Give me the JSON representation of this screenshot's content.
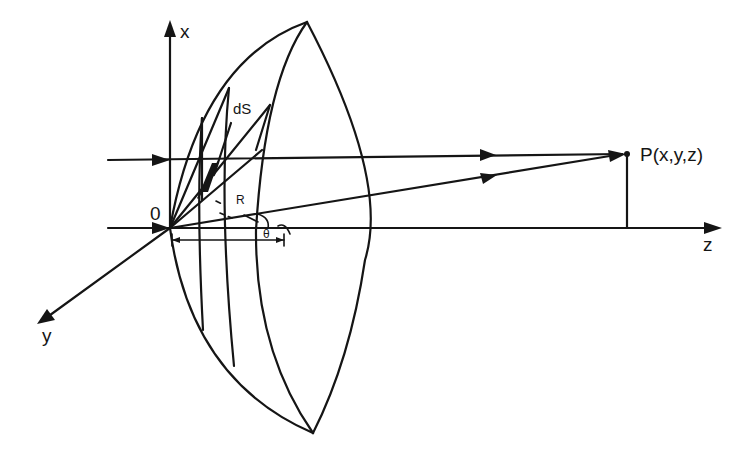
{
  "figure": {
    "type": "geometric-optics-diagram",
    "colors": {
      "stroke": "#151515",
      "background": "#ffffff"
    }
  },
  "labels": {
    "x_axis": "x",
    "y_axis": "y",
    "z_axis": "z",
    "origin": "0",
    "point": "P(x,y,z)",
    "surface_element": "dS",
    "radius": "R",
    "angle": "θ"
  },
  "axes": [
    {
      "name": "x-axis",
      "direction": "up"
    },
    {
      "name": "y-axis",
      "direction": "down-left"
    },
    {
      "name": "z-axis",
      "direction": "right"
    }
  ],
  "rays": [
    {
      "name": "upper-incident-ray",
      "target": "P(x,y,z)"
    },
    {
      "name": "axial-incident-ray",
      "target": "0"
    },
    {
      "name": "radial-ray",
      "from": "0",
      "target": "P(x,y,z)"
    }
  ]
}
